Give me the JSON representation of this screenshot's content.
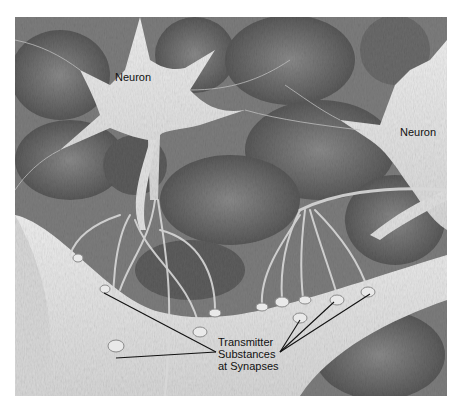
{
  "figure": {
    "type": "pencil illustration",
    "palette": {
      "background": "#ffffff",
      "tissue_dark": "#5a5a5a",
      "tissue_mid": "#8c8c8c",
      "cell_body": "#e6e6e6",
      "label_text": "#111111",
      "pointer_lines": "#111111"
    },
    "labels": {
      "neuron_left": "Neuron",
      "neuron_right": "Neuron",
      "synapse_lines": [
        "Transmitter",
        "Substances",
        "at Synapses"
      ]
    }
  }
}
